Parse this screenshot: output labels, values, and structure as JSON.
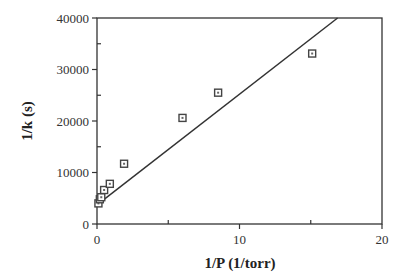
{
  "chart_data": {
    "type": "scatter",
    "title": "",
    "xlabel": "1/P (1/torr)",
    "ylabel": "1/k  (s)",
    "xlim": [
      0,
      20
    ],
    "ylim": [
      0,
      40000
    ],
    "x_ticks": [
      0,
      10,
      20
    ],
    "x_tick_labels": [
      "0",
      "10",
      "20"
    ],
    "y_ticks": [
      0,
      10000,
      20000,
      30000,
      40000
    ],
    "y_tick_labels": [
      "0",
      "10000",
      "20000",
      "30000",
      "40000"
    ],
    "grid": false,
    "legend": "none",
    "series": [
      {
        "name": "data",
        "marker": "square",
        "x": [
          0.1,
          0.2,
          0.3,
          0.5,
          0.9,
          1.9,
          6.0,
          8.5,
          15.1
        ],
        "y": [
          4000,
          4800,
          5200,
          6600,
          7800,
          11700,
          20600,
          25500,
          33100
        ]
      }
    ],
    "fit_line": {
      "name": "linear fit",
      "intercept": 3700,
      "slope": 2150
    }
  }
}
